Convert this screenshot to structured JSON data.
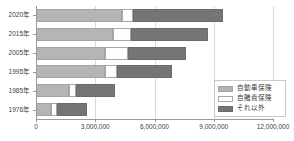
{
  "chart_data": {
    "type": "bar",
    "orientation": "horizontal",
    "stacked": true,
    "title": "",
    "xlabel": "",
    "ylabel": "",
    "xlim": [
      0,
      12000000
    ],
    "ylim": null,
    "grid": true,
    "legend_position": "bottom-right",
    "categories": [
      "1976年",
      "1985年",
      "1995年",
      "2005年",
      "2015年",
      "2020年"
    ],
    "xticks": [
      0,
      3000000,
      6000000,
      9000000,
      12000000
    ],
    "xticklabels": [
      "0",
      "3,000,000",
      "6,000,000",
      "9,000,000",
      "12,000,000"
    ],
    "series": [
      {
        "name": "自動車保険",
        "color": "#b5b5b5",
        "values": [
          760000,
          1680000,
          3490000,
          3490000,
          3900000,
          4350000
        ]
      },
      {
        "name": "自賭責保険",
        "color": "#fdfdfd",
        "values": [
          300000,
          360000,
          620000,
          1170000,
          920000,
          560000
        ]
      },
      {
        "name": "それ以外",
        "color": "#757575",
        "values": [
          1520000,
          1960000,
          2790000,
          2950000,
          3880000,
          4540000
        ]
      }
    ],
    "totals": [
      2580000,
      4000000,
      6900000,
      7610000,
      8700000,
      9450000
    ]
  },
  "legend": {
    "items": [
      {
        "label": "自動車保険",
        "swatch": "legend-swatch-auto"
      },
      {
        "label": "自賭責保険",
        "swatch": "legend-swatch-jibaiseki"
      },
      {
        "label": "それ以外",
        "swatch": "legend-swatch-other"
      }
    ]
  },
  "colors": {
    "auto_insurance": "#b5b5b5",
    "compulsory_insurance": "#fdfdfd",
    "other": "#757575",
    "gridline": "#d9d9d9",
    "axis": "#9a9a9a",
    "text": "#404040"
  }
}
